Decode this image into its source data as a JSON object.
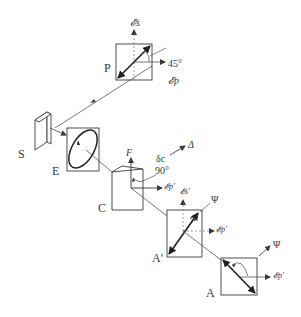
{
  "diagram": {
    "type": "ellipsometer optical path schematic",
    "components": {
      "polarizer": {
        "label": "P",
        "angle_label": "45°",
        "s_field": "𝓔s",
        "p_field": "𝓔p"
      },
      "sample": {
        "label": "S"
      },
      "ellipse": {
        "label": "E"
      },
      "compensator": {
        "label": "C",
        "fast_axis": "F",
        "angle_label": "90°",
        "retardance": "δc",
        "delta": "Δ",
        "p_field": "𝓔p'"
      },
      "analyzer_prime": {
        "label": "A'",
        "psi": "Ψ",
        "s_field": "𝓔s'",
        "p_field": "𝓔p'"
      },
      "analyzer": {
        "label": "A",
        "psi": "Ψ",
        "p_field": "𝓔p'"
      }
    }
  },
  "colors": {
    "line": "#3a3a3a",
    "dashed": "#7a7a7a",
    "background": "#ffffff"
  }
}
